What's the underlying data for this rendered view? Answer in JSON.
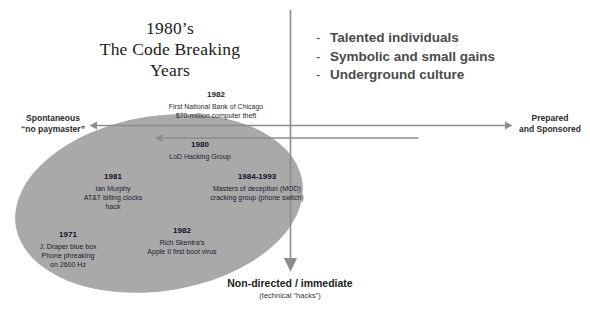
{
  "title": {
    "line1": "1980’s",
    "line2": "The Code Breaking",
    "line3": "Years"
  },
  "bullets": {
    "dash": "-",
    "items": [
      "Talented individuals",
      "Symbolic and small gains",
      "Underground culture"
    ]
  },
  "axes": {
    "left_label_line1": "Spontaneous",
    "left_label_line2": "“no paymaster”",
    "right_label_line1": "Prepared",
    "right_label_line2": "and Sponsored",
    "bottom_label_main": "Non-directed / immediate",
    "bottom_label_sub": "(technical “hacks”)",
    "axis_color": "#8c8c8c"
  },
  "ellipse": {
    "fill": "#a9a9a9",
    "rotation_deg": -9
  },
  "events": [
    {
      "id": "chicago",
      "year": "1982",
      "desc_line1": "First National Bank of Chicago",
      "desc_line2": "$70-million computer theft"
    },
    {
      "id": "lod",
      "year": "1980",
      "desc_line1": "LoD Hacking Group",
      "desc_line2": ""
    },
    {
      "id": "murphy",
      "year": "1981",
      "desc_line1": "Ian Murphy",
      "desc_line2": "AT&T billing clocks",
      "desc_line3": "hack"
    },
    {
      "id": "mod",
      "year": "1984-1993",
      "desc_line1": "Masters of deception (MOD)",
      "desc_line2": "cracking group (phone switch)"
    },
    {
      "id": "skentra",
      "year": "1982",
      "desc_line1": "Rich Skentra’s",
      "desc_line2": "Apple II first boot virus"
    },
    {
      "id": "draper",
      "year": "1971",
      "desc_line1": "J. Draper blue box",
      "desc_line2": "Phone phreaking",
      "desc_line3": "on 2600 Hz"
    }
  ]
}
